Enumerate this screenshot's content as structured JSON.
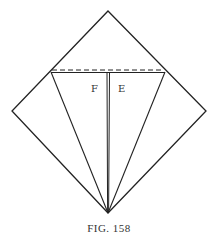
{
  "figure": {
    "labels": {
      "left": "F",
      "right": "E"
    },
    "caption": {
      "prefix": "FIG.",
      "number": "158"
    },
    "colors": {
      "line": "#222222",
      "background": "#ffffff"
    }
  }
}
